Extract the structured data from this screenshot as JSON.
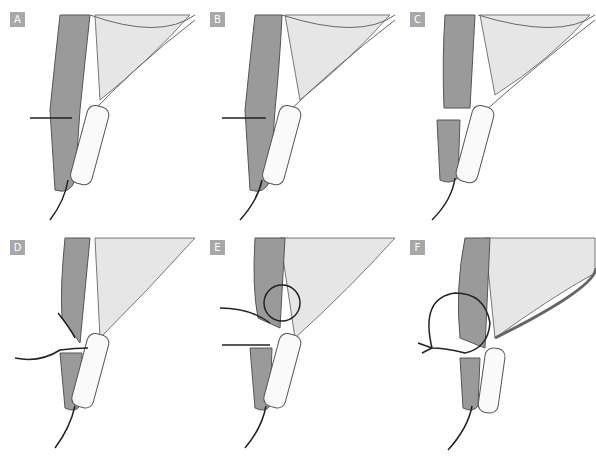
{
  "figure": {
    "panels": [
      {
        "label": "A",
        "step": "incision-marked"
      },
      {
        "label": "B",
        "step": "incision-line"
      },
      {
        "label": "C",
        "step": "tissue-divided"
      },
      {
        "label": "D",
        "step": "suture-passed"
      },
      {
        "label": "E",
        "step": "suture-loop"
      },
      {
        "label": "F",
        "step": "suture-tied"
      }
    ],
    "colors": {
      "badge": "#a8a8a8",
      "outline": "#555555",
      "fat": "#e6e6e6",
      "muscle": "#7a7a7a",
      "suture": "#222222"
    }
  }
}
